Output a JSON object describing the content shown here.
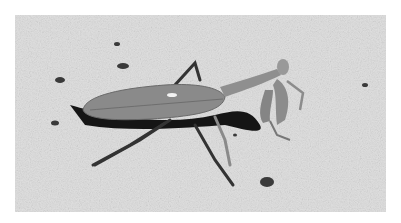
{
  "image": {
    "subject": "praying mantis",
    "setting": "sandy ground",
    "style": "grayscale photograph",
    "colors": {
      "border": "#ffffff",
      "sand": "#dcdcdc",
      "mantis": "#8a8a8a",
      "shadow": "#141414"
    }
  }
}
